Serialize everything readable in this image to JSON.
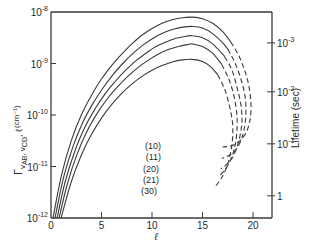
{
  "chart_data": {
    "type": "line",
    "title": "",
    "xlabel": "ℓ",
    "ylabel": "Γ v_AB, v_CD, ℓ (cm⁻¹)",
    "y2label": "Lifetime (sec)",
    "xlim": [
      0,
      21.9
    ],
    "ylim_log10": [
      -12,
      -8
    ],
    "yscale": "log",
    "grid": false,
    "x_ticks": [
      0,
      5,
      10,
      15,
      20
    ],
    "x_tick_labels": [
      "0",
      "5",
      "10",
      "15",
      "20"
    ],
    "y_ticks_log10": [
      -8,
      -9,
      -10,
      -11,
      -12
    ],
    "y_tick_labels": [
      {
        "base": "10",
        "exp": "-8"
      },
      {
        "base": "10",
        "exp": "-9"
      },
      {
        "base": "10",
        "exp": "-10"
      },
      {
        "base": "10",
        "exp": "-11"
      },
      {
        "base": "10",
        "exp": "-12"
      }
    ],
    "y2_ticks": [
      {
        "label_base": "10",
        "label_exp": "-3",
        "value": 0.001,
        "y_log10_equiv": -8.6
      },
      {
        "label_base": "10",
        "label_exp": "-2",
        "value": 0.01,
        "y_log10_equiv": -9.55
      },
      {
        "label_base": "10",
        "label_exp": "-1",
        "value": 0.1,
        "y_log10_equiv": -10.56
      },
      {
        "label_base": "1",
        "label_exp": "",
        "value": 1,
        "y_log10_equiv": -11.57
      }
    ],
    "series": [
      {
        "name": "(10)",
        "solid": [
          [
            0.2,
            -12.0
          ],
          [
            1,
            -11.2
          ],
          [
            2,
            -10.5
          ],
          [
            3,
            -10.0
          ],
          [
            4,
            -9.62
          ],
          [
            5,
            -9.3
          ],
          [
            6,
            -9.04
          ],
          [
            7,
            -8.82
          ],
          [
            8,
            -8.62
          ],
          [
            9,
            -8.45
          ],
          [
            10,
            -8.32
          ],
          [
            11,
            -8.22
          ],
          [
            12,
            -8.15
          ],
          [
            13,
            -8.11
          ],
          [
            14,
            -8.1
          ],
          [
            15,
            -8.13
          ],
          [
            16,
            -8.22
          ],
          [
            17,
            -8.38
          ],
          [
            17.8,
            -8.58
          ]
        ],
        "dashed": [
          [
            17.8,
            -8.58
          ],
          [
            18.6,
            -8.85
          ],
          [
            19.2,
            -9.15
          ],
          [
            19.6,
            -9.45
          ],
          [
            19.8,
            -9.8
          ],
          [
            19.7,
            -10.1
          ],
          [
            19.3,
            -10.35
          ],
          [
            18.6,
            -10.52
          ],
          [
            17.8,
            -10.6
          ],
          [
            17.0,
            -10.62
          ]
        ]
      },
      {
        "name": "(11)",
        "solid": [
          [
            0.4,
            -12.0
          ],
          [
            1.2,
            -11.25
          ],
          [
            2.2,
            -10.6
          ],
          [
            3.2,
            -10.12
          ],
          [
            4.2,
            -9.76
          ],
          [
            5.2,
            -9.46
          ],
          [
            6.2,
            -9.2
          ],
          [
            7.2,
            -8.98
          ],
          [
            8.2,
            -8.79
          ],
          [
            9.2,
            -8.63
          ],
          [
            10.2,
            -8.5
          ],
          [
            11.2,
            -8.4
          ],
          [
            12.2,
            -8.33
          ],
          [
            13.2,
            -8.29
          ],
          [
            14,
            -8.28
          ],
          [
            15,
            -8.31
          ],
          [
            16,
            -8.42
          ],
          [
            17,
            -8.6
          ],
          [
            17.5,
            -8.72
          ]
        ],
        "dashed": [
          [
            17.5,
            -8.72
          ],
          [
            18.2,
            -8.98
          ],
          [
            18.8,
            -9.3
          ],
          [
            19.2,
            -9.62
          ],
          [
            19.3,
            -9.95
          ],
          [
            19.1,
            -10.3
          ],
          [
            18.6,
            -10.58
          ],
          [
            17.9,
            -10.75
          ],
          [
            17.1,
            -10.83
          ],
          [
            16.9,
            -10.84
          ]
        ]
      },
      {
        "name": "(20)",
        "solid": [
          [
            0.6,
            -12.0
          ],
          [
            1.4,
            -11.3
          ],
          [
            2.4,
            -10.68
          ],
          [
            3.4,
            -10.22
          ],
          [
            4.4,
            -9.87
          ],
          [
            5.4,
            -9.58
          ],
          [
            6.4,
            -9.34
          ],
          [
            7.4,
            -9.13
          ],
          [
            8.4,
            -8.95
          ],
          [
            9.4,
            -8.8
          ],
          [
            10.4,
            -8.67
          ],
          [
            11.4,
            -8.58
          ],
          [
            12.4,
            -8.51
          ],
          [
            13.4,
            -8.47
          ],
          [
            14,
            -8.46
          ],
          [
            15,
            -8.5
          ],
          [
            16,
            -8.62
          ],
          [
            17,
            -8.82
          ],
          [
            17.2,
            -8.87
          ]
        ],
        "dashed": [
          [
            17.2,
            -8.87
          ],
          [
            17.9,
            -9.12
          ],
          [
            18.4,
            -9.45
          ],
          [
            18.8,
            -9.8
          ],
          [
            18.9,
            -10.15
          ],
          [
            18.6,
            -10.5
          ],
          [
            18.1,
            -10.78
          ],
          [
            17.4,
            -10.96
          ],
          [
            16.8,
            -11.04
          ]
        ]
      },
      {
        "name": "(21)",
        "solid": [
          [
            0.8,
            -12.0
          ],
          [
            1.6,
            -11.35
          ],
          [
            2.6,
            -10.75
          ],
          [
            3.6,
            -10.3
          ],
          [
            4.6,
            -9.96
          ],
          [
            5.6,
            -9.68
          ],
          [
            6.6,
            -9.45
          ],
          [
            7.6,
            -9.25
          ],
          [
            8.6,
            -9.08
          ],
          [
            9.6,
            -8.94
          ],
          [
            10.6,
            -8.82
          ],
          [
            11.6,
            -8.73
          ],
          [
            12.6,
            -8.67
          ],
          [
            13.6,
            -8.63
          ],
          [
            14,
            -8.62
          ],
          [
            15,
            -8.67
          ],
          [
            16,
            -8.8
          ],
          [
            16.9,
            -9.02
          ]
        ],
        "dashed": [
          [
            16.9,
            -9.02
          ],
          [
            17.6,
            -9.3
          ],
          [
            18.1,
            -9.62
          ],
          [
            18.4,
            -9.98
          ],
          [
            18.4,
            -10.35
          ],
          [
            18.1,
            -10.7
          ],
          [
            17.5,
            -10.98
          ],
          [
            16.8,
            -11.16
          ],
          [
            16.6,
            -11.2
          ]
        ]
      },
      {
        "name": "(30)",
        "solid": [
          [
            1.0,
            -12.0
          ],
          [
            2,
            -11.3
          ],
          [
            3,
            -10.78
          ],
          [
            4,
            -10.38
          ],
          [
            5,
            -10.06
          ],
          [
            6,
            -9.8
          ],
          [
            7,
            -9.58
          ],
          [
            8,
            -9.4
          ],
          [
            9,
            -9.25
          ],
          [
            10,
            -9.13
          ],
          [
            11,
            -9.04
          ],
          [
            12,
            -8.97
          ],
          [
            13,
            -8.93
          ],
          [
            14,
            -8.92
          ],
          [
            15,
            -8.96
          ],
          [
            15.8,
            -9.06
          ],
          [
            16.5,
            -9.22
          ]
        ],
        "dashed": [
          [
            16.5,
            -9.22
          ],
          [
            17.2,
            -9.5
          ],
          [
            17.7,
            -9.85
          ],
          [
            18.0,
            -10.22
          ],
          [
            17.9,
            -10.6
          ],
          [
            17.5,
            -10.95
          ],
          [
            16.9,
            -11.22
          ],
          [
            16.3,
            -11.38
          ]
        ]
      }
    ],
    "curve_labels": [
      {
        "text": "(10)",
        "x": 10.6,
        "y_log10": -10.6
      },
      {
        "text": "(11)",
        "x": 10.6,
        "y_log10": -10.82
      },
      {
        "text": "(20)",
        "x": 10.4,
        "y_log10": -11.04
      },
      {
        "text": "(21)",
        "x": 10.4,
        "y_log10": -11.26
      },
      {
        "text": "(30)",
        "x": 10.2,
        "y_log10": -11.48
      }
    ]
  },
  "labels": {
    "x_axis_title": "ℓ",
    "y_axis_title_main": "Γ",
    "y_axis_title_sub1": "v",
    "y_axis_title_sub1b": "AB",
    "y_axis_title_sep": ", v",
    "y_axis_title_sub2": "CD",
    "y_axis_title_tail": ", ℓ",
    "y_axis_title_units": "(cm⁻¹)",
    "y2_axis_title": "Lifetime (sec)"
  }
}
